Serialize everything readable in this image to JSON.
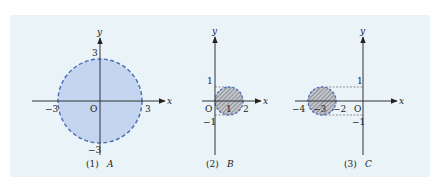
{
  "colors": {
    "background": "#eaf3f8",
    "fill_A": "#c4d5ef",
    "border": "#4a6bb5",
    "hatch_fill": "#bfc4cc",
    "hatch_line": "#6d6d6d",
    "axis": "#333333"
  },
  "diagrams": [
    {
      "id": "A",
      "caption_num": "(1)",
      "caption_set": "A",
      "axis_x_label": "x",
      "axis_y_label": "y",
      "origin_label": "O",
      "ticks": {
        "x_neg": "−3",
        "x_pos": "3",
        "y_pos": "3",
        "y_neg": "−3"
      },
      "shape": "disk, center (0,0), radius 3, dashed boundary, solid blue fill"
    },
    {
      "id": "B",
      "caption_num": "(2)",
      "caption_set": "B",
      "axis_x_label": "x",
      "axis_y_label": "y",
      "origin_label": "O",
      "ticks": {
        "x1": "1",
        "x2": "2",
        "y_pos": "1",
        "y_neg": "−1"
      },
      "shape": "disk, center (1,0), radius 1, dashed boundary, hatched fill"
    },
    {
      "id": "C",
      "caption_num": "(3)",
      "caption_set": "C",
      "axis_x_label": "x",
      "axis_y_label": "y",
      "origin_label": "O",
      "ticks": {
        "x_a": "−4",
        "x_b": "−3",
        "x_c": "−2",
        "y_pos": "1",
        "y_neg": "−1"
      },
      "shape": "disk, center (−3,0), radius 1, dashed boundary, hatched fill"
    }
  ]
}
